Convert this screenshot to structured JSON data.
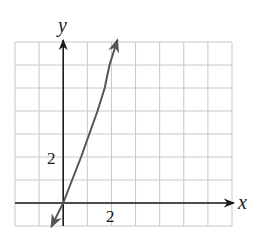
{
  "chart_data": {
    "type": "line",
    "title": "",
    "xlabel": "x",
    "ylabel": "y",
    "xlim": [
      -2,
      7
    ],
    "ylim": [
      -1,
      7
    ],
    "grid": true,
    "grid_step": 1,
    "tick_labels": {
      "x": [
        {
          "value": 2,
          "label": "2"
        }
      ],
      "y": [
        {
          "value": 2,
          "label": "2"
        }
      ]
    },
    "series": [
      {
        "name": "curve",
        "arrows_both_ends": true,
        "x": [
          -0.5,
          0,
          0.37,
          0.74,
          1.08,
          1.42,
          1.72,
          1.92,
          2.25
        ],
        "y": [
          -1.04,
          0,
          1,
          2,
          3,
          4,
          5,
          6,
          7.1
        ]
      }
    ],
    "legend": null
  },
  "labels": {
    "x_axis": "x",
    "y_axis": "y",
    "x_tick": "2",
    "y_tick": "2"
  },
  "colors": {
    "grid": "#c8c8c8",
    "axes": "#1a1a1a",
    "curve": "#555555"
  }
}
